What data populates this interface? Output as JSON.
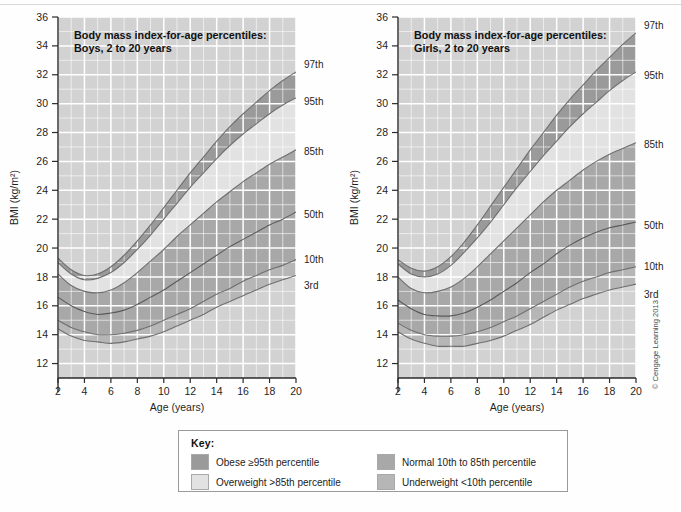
{
  "legend": {
    "title": "Key:",
    "items": [
      {
        "label": "Obese ≥95th percentile",
        "color": "#9a9a9a",
        "name": "obese"
      },
      {
        "label": "Normal 10th to 85th percentile",
        "color": "#a8a8a8",
        "name": "normal"
      },
      {
        "label": "Overweight >85th percentile",
        "color": "#e2e2e2",
        "name": "overweight"
      },
      {
        "label": "Underweight <10th percentile",
        "color": "#b6b6b6",
        "name": "underweight"
      }
    ]
  },
  "copyright": "© Cengage Learning 2013",
  "colors": {
    "plot_background": "#d2d2d2",
    "obese_band": "#9a9a9a",
    "overweight_band": "#e2e2e2",
    "normal_band": "#a8a8a8",
    "underweight_band": "#b6b6b6",
    "gridline": "#ffffff",
    "axis": "#2b2b2b"
  },
  "chart_data": [
    {
      "type": "area",
      "name": "boys",
      "title": "Body mass index-for-age percentiles:\nBoys, 2 to 20 years",
      "title_line1": "Body mass index-for-age percentiles:",
      "title_line2": "Boys, 2 to 20 years",
      "xlabel": "Age (years)",
      "ylabel": "BMI (kg/m²)",
      "xlim": [
        2,
        20
      ],
      "ylim": [
        11,
        36
      ],
      "xticks": [
        2,
        4,
        6,
        8,
        10,
        12,
        14,
        16,
        18,
        20
      ],
      "yticks": [
        12,
        14,
        16,
        18,
        20,
        22,
        24,
        26,
        28,
        30,
        32,
        34,
        36
      ],
      "grid": true,
      "legend_position": "outside-right",
      "x": [
        2,
        3,
        4,
        5,
        6,
        7,
        8,
        9,
        10,
        11,
        12,
        13,
        14,
        15,
        16,
        17,
        18,
        19,
        20
      ],
      "series": [
        {
          "name": "97th",
          "label": "97th",
          "values": [
            19.3,
            18.5,
            18.1,
            18.2,
            18.7,
            19.5,
            20.5,
            21.6,
            22.8,
            24.0,
            25.2,
            26.3,
            27.4,
            28.4,
            29.3,
            30.1,
            30.9,
            31.6,
            32.2
          ]
        },
        {
          "name": "95th",
          "label": "95th",
          "values": [
            19.0,
            18.2,
            17.8,
            17.9,
            18.3,
            19.0,
            19.9,
            20.9,
            22.0,
            23.1,
            24.2,
            25.2,
            26.2,
            27.1,
            27.9,
            28.6,
            29.3,
            29.9,
            30.4
          ]
        },
        {
          "name": "85th",
          "label": "85th",
          "values": [
            18.2,
            17.4,
            17.0,
            16.9,
            17.1,
            17.6,
            18.3,
            19.1,
            19.9,
            20.8,
            21.6,
            22.4,
            23.2,
            23.9,
            24.6,
            25.2,
            25.8,
            26.3,
            26.8
          ]
        },
        {
          "name": "50th",
          "label": "50th",
          "values": [
            16.6,
            16.0,
            15.6,
            15.4,
            15.5,
            15.7,
            16.1,
            16.6,
            17.1,
            17.7,
            18.3,
            18.9,
            19.5,
            20.1,
            20.6,
            21.1,
            21.6,
            22.0,
            22.5
          ]
        },
        {
          "name": "10th",
          "label": "10th",
          "values": [
            15.0,
            14.5,
            14.2,
            14.0,
            14.0,
            14.1,
            14.3,
            14.6,
            15.0,
            15.4,
            15.8,
            16.3,
            16.8,
            17.2,
            17.7,
            18.1,
            18.5,
            18.8,
            19.2
          ]
        },
        {
          "name": "3rd",
          "label": "3rd",
          "values": [
            14.4,
            13.9,
            13.6,
            13.5,
            13.4,
            13.5,
            13.7,
            13.9,
            14.2,
            14.6,
            15.0,
            15.4,
            15.9,
            16.3,
            16.7,
            17.1,
            17.5,
            17.8,
            18.1
          ]
        }
      ]
    },
    {
      "type": "area",
      "name": "girls",
      "title": "Body mass index-for-age percentiles:\nGirls, 2 to 20 years",
      "title_line1": "Body mass index-for-age percentiles:",
      "title_line2": "Girls, 2 to 20 years",
      "xlabel": "Age (years)",
      "ylabel": "BMI (kg/m²)",
      "xlim": [
        2,
        20
      ],
      "ylim": [
        11,
        36
      ],
      "xticks": [
        2,
        4,
        6,
        8,
        10,
        12,
        14,
        16,
        18,
        20
      ],
      "yticks": [
        12,
        14,
        16,
        18,
        20,
        22,
        24,
        26,
        28,
        30,
        32,
        34,
        36
      ],
      "grid": true,
      "legend_position": "outside-right",
      "x": [
        2,
        3,
        4,
        5,
        6,
        7,
        8,
        9,
        10,
        11,
        12,
        13,
        14,
        15,
        16,
        17,
        18,
        19,
        20
      ],
      "series": [
        {
          "name": "97th",
          "label": "97th",
          "values": [
            19.2,
            18.6,
            18.4,
            18.7,
            19.4,
            20.4,
            21.6,
            22.9,
            24.2,
            25.5,
            26.8,
            28.0,
            29.2,
            30.3,
            31.3,
            32.3,
            33.2,
            34.1,
            34.9
          ]
        },
        {
          "name": "95th",
          "label": "95th",
          "values": [
            18.9,
            18.2,
            18.0,
            18.2,
            18.8,
            19.7,
            20.7,
            21.8,
            23.0,
            24.2,
            25.3,
            26.4,
            27.4,
            28.4,
            29.3,
            30.1,
            30.9,
            31.6,
            32.2
          ]
        },
        {
          "name": "85th",
          "label": "85th",
          "values": [
            18.0,
            17.2,
            16.9,
            17.0,
            17.3,
            17.9,
            18.7,
            19.6,
            20.5,
            21.4,
            22.3,
            23.2,
            24.0,
            24.7,
            25.4,
            26.0,
            26.5,
            26.9,
            27.3
          ]
        },
        {
          "name": "50th",
          "label": "50th",
          "values": [
            16.4,
            15.8,
            15.4,
            15.3,
            15.3,
            15.5,
            15.9,
            16.4,
            17.0,
            17.6,
            18.3,
            18.9,
            19.6,
            20.2,
            20.7,
            21.1,
            21.4,
            21.6,
            21.8
          ]
        },
        {
          "name": "10th",
          "label": "10th",
          "values": [
            14.8,
            14.3,
            14.0,
            13.9,
            13.9,
            14.0,
            14.2,
            14.5,
            14.9,
            15.3,
            15.8,
            16.3,
            16.8,
            17.3,
            17.7,
            18.0,
            18.3,
            18.5,
            18.7
          ]
        },
        {
          "name": "3rd",
          "label": "3rd",
          "values": [
            14.2,
            13.7,
            13.4,
            13.2,
            13.2,
            13.2,
            13.4,
            13.6,
            13.9,
            14.3,
            14.7,
            15.2,
            15.7,
            16.1,
            16.5,
            16.8,
            17.1,
            17.3,
            17.5
          ]
        }
      ]
    }
  ]
}
